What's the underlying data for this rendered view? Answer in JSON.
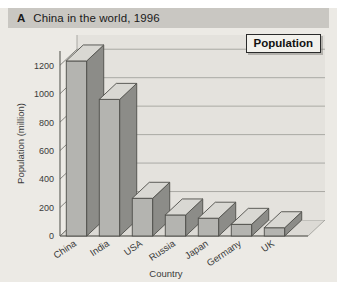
{
  "figure": {
    "letter": "A",
    "title": "China in the world, 1996"
  },
  "legend": {
    "label": "Population"
  },
  "chart_data": {
    "type": "bar",
    "title": "China in the world, 1996",
    "xlabel": "Country",
    "ylabel": "Population (million)",
    "categories": [
      "China",
      "India",
      "USA",
      "Russia",
      "Japan",
      "Germany",
      "UK"
    ],
    "values": [
      1230,
      960,
      265,
      148,
      125,
      82,
      58
    ],
    "ylim": [
      0,
      1300
    ],
    "yticks": [
      0,
      200,
      400,
      600,
      800,
      1000,
      1200
    ],
    "ytick_labels": [
      "0",
      "200",
      "400",
      "600",
      "800",
      "1000",
      "1200"
    ],
    "grid": true,
    "legend_entries": [
      "Population"
    ],
    "legend_position": "top-right",
    "style": "3d-bar",
    "colors": {
      "bar_front": "#b4b4b0",
      "bar_side": "#8c8c88",
      "bar_top": "#d9d8d3",
      "background": "#eceae5",
      "titlebar": "#c9c7c2",
      "axis": "#555555",
      "grid": "#9a9a95"
    }
  }
}
